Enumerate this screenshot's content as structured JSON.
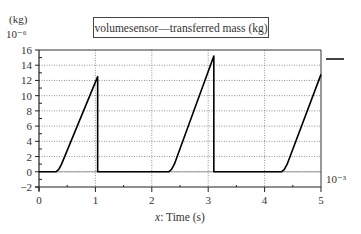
{
  "chart_data": {
    "type": "line",
    "title": "volumesensor—transferred mass (kg)",
    "xlabel_italic": "x",
    "xlabel_rest": ": Time (s)",
    "xlabel": "x: Time (s)",
    "ylabel": "(kg)",
    "y_scale_label": "10⁻⁶",
    "x_scale_label": "10⁻³",
    "xlim": [
      0,
      5
    ],
    "ylim": [
      -2,
      16
    ],
    "x_ticks": [
      0,
      1,
      2,
      3,
      4,
      5
    ],
    "y_ticks": [
      -2,
      0,
      2,
      4,
      6,
      8,
      10,
      12,
      14,
      16
    ],
    "grid": true,
    "legend_position": "right",
    "series": [
      {
        "name": "volumesensor—transferred mass",
        "color": "#000000",
        "x": [
          0,
          0.3,
          0.35,
          0.4,
          1.04,
          1.04,
          2.3,
          2.35,
          2.4,
          3.1,
          3.1,
          4.3,
          4.35,
          4.4,
          5.0
        ],
        "y": [
          0,
          0,
          0.3,
          1.0,
          12.5,
          0,
          0,
          0.3,
          1.0,
          15.2,
          0,
          0,
          0.3,
          1.0,
          12.8
        ]
      }
    ]
  }
}
